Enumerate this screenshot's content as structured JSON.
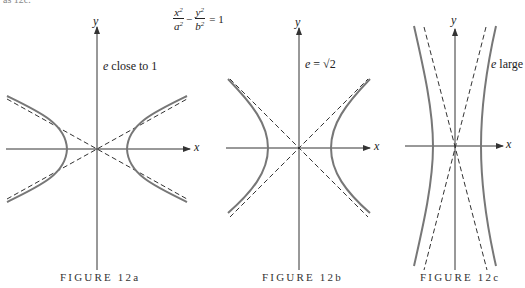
{
  "header": {
    "cut_text": "as 12c."
  },
  "equation": {
    "term1_num": "x",
    "term1_den": "a",
    "minus": "−",
    "term2_num": "y",
    "term2_den": "b",
    "exp": "2",
    "rhs": "= 1"
  },
  "figures": [
    {
      "id": "12a",
      "caption": "FIGURE 12a",
      "label": "close to 1",
      "label_var": "e",
      "x_axis": "x",
      "y_axis": "y"
    },
    {
      "id": "12b",
      "caption": "FIGURE 12b",
      "label": "= √2",
      "label_var": "e",
      "x_axis": "x",
      "y_axis": "y"
    },
    {
      "id": "12c",
      "caption": "FIGURE 12c",
      "label": "large",
      "label_var": "e",
      "x_axis": "x",
      "y_axis": "y"
    }
  ],
  "colors": {
    "axis": "#333333",
    "curve": "#777777",
    "asymptote": "#333333"
  }
}
